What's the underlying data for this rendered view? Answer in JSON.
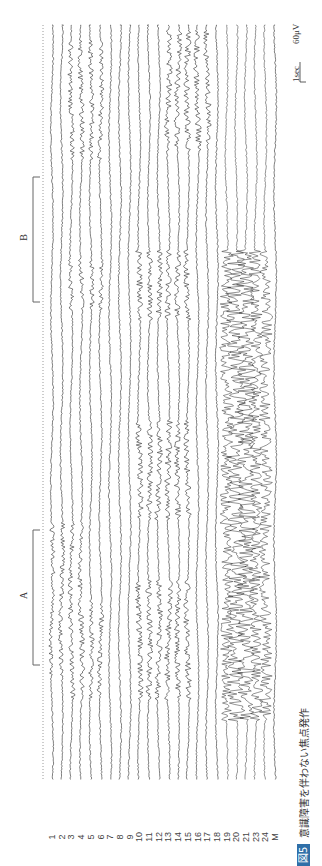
{
  "figure": {
    "caption_badge": "図5",
    "caption_text": "意識障害を伴わない焦点発作",
    "brackets": [
      {
        "label": "A",
        "y_start": 530,
        "y_end": 665
      },
      {
        "label": "B",
        "y_start": 177,
        "y_end": 302
      }
    ],
    "scale_bar": {
      "time": "1sec",
      "amplitude": "60μV"
    },
    "channels": [
      "1",
      "2",
      "3",
      "4",
      "5",
      "6",
      "7",
      "8",
      "9",
      "10",
      "11",
      "12",
      "13",
      "14",
      "15",
      "16",
      "17",
      "18",
      "19",
      "20",
      "21",
      "23",
      "24",
      "M"
    ],
    "colors": {
      "trace": "#2a2a2a",
      "badge": "#2f6fa8",
      "bracket": "#666666",
      "timeline": "#9a9a9a"
    }
  },
  "chart_data": {
    "type": "line",
    "title": "意識障害を伴わない焦点発作",
    "subtitle": "EEG recording (rotated 90°), focal seizure without impaired awareness",
    "xlabel": "time",
    "ylabel": "channel",
    "series_names": [
      "1",
      "2",
      "3",
      "4",
      "5",
      "6",
      "7",
      "8",
      "9",
      "10",
      "11",
      "12",
      "13",
      "14",
      "15",
      "16",
      "17",
      "18",
      "19",
      "20",
      "21",
      "23",
      "24",
      "M"
    ],
    "annotations": [
      {
        "label": "A",
        "description": "bracketed segment A (earlier epoch)"
      },
      {
        "label": "B",
        "description": "bracketed segment B (later epoch)"
      }
    ],
    "scale": {
      "time": "1sec",
      "amplitude": "60μV"
    },
    "grid": false
  }
}
